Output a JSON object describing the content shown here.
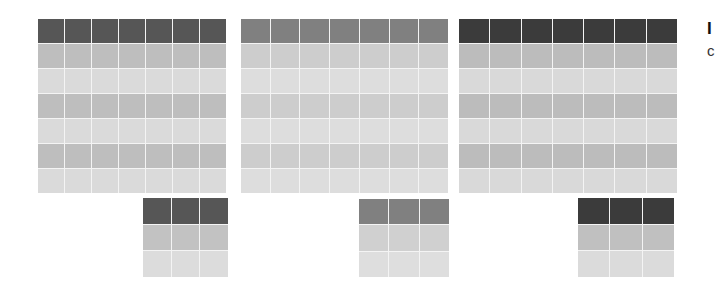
{
  "figure": {
    "type": "table-style-swatches",
    "description_visible": false
  },
  "tables": [
    {
      "id": "table-1",
      "columns": 7,
      "rows": 7,
      "box": {
        "x": 38,
        "y": 19,
        "w": 188,
        "h": 174
      },
      "header_color": "#565656",
      "band_colors": [
        "#bebebe",
        "#dadada"
      ],
      "mini": {
        "columns": 3,
        "rows": 3,
        "box": {
          "x": 143,
          "y": 198,
          "w": 85,
          "h": 79
        },
        "header_color": "#565656",
        "band_colors": [
          "#c2c2c2",
          "#dcdcdc"
        ]
      }
    },
    {
      "id": "table-2",
      "columns": 7,
      "rows": 7,
      "box": {
        "x": 241,
        "y": 19,
        "w": 207,
        "h": 174
      },
      "header_color": "#808080",
      "band_colors": [
        "#cdcdcd",
        "#dddddd"
      ],
      "mini": {
        "columns": 3,
        "rows": 3,
        "box": {
          "x": 359,
          "y": 199,
          "w": 90,
          "h": 78
        },
        "header_color": "#808080",
        "band_colors": [
          "#d0d0d0",
          "#dedede"
        ]
      }
    },
    {
      "id": "table-3",
      "columns": 7,
      "rows": 7,
      "box": {
        "x": 459,
        "y": 19,
        "w": 218,
        "h": 174
      },
      "header_color": "#3b3b3b",
      "band_colors": [
        "#bcbcbc",
        "#d9d9d9"
      ],
      "mini": {
        "columns": 3,
        "rows": 3,
        "box": {
          "x": 578,
          "y": 198,
          "w": 96,
          "h": 79
        },
        "header_color": "#3b3b3b",
        "band_colors": [
          "#c0c0c0",
          "#dbdbdb"
        ]
      }
    }
  ],
  "side_text": {
    "title_fragment": "I",
    "subtitle_fragment": "c"
  }
}
